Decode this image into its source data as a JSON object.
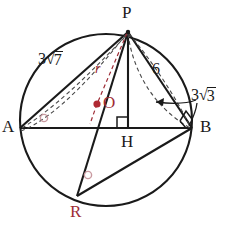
{
  "figure": {
    "kind": "circle-geometry-diagram",
    "colors": {
      "stroke": "#1a1a1a",
      "accent_red": "#9e2b35",
      "angle_mark": "#c99aa0",
      "background": "#ffffff"
    }
  },
  "points": {
    "P": {
      "label": "P",
      "x": 128,
      "y": 32,
      "label_x": 122,
      "label_y": 4,
      "color": "#1a1a1a"
    },
    "A": {
      "label": "A",
      "x": 20,
      "y": 128,
      "label_x": 2,
      "label_y": 120,
      "color": "#1a1a1a"
    },
    "B": {
      "label": "B",
      "x": 192,
      "y": 128,
      "label_x": 199,
      "label_y": 120,
      "color": "#1a1a1a"
    },
    "H": {
      "label": "H",
      "x": 128,
      "y": 128,
      "label_x": 121,
      "label_y": 133,
      "color": "#1a1a1a"
    },
    "O": {
      "label": "O",
      "x": 97,
      "y": 104,
      "label_x": 103,
      "label_y": 95,
      "color": "#9e2b35"
    },
    "R": {
      "label": "R",
      "x": 77,
      "y": 196,
      "label_x": 70,
      "label_y": 204,
      "color": "#9e2b35"
    }
  },
  "circle": {
    "cx": 106,
    "cy": 120,
    "r": 86
  },
  "segment_labels": [
    {
      "name": "AP",
      "text_prefix": "3",
      "radicand": "7",
      "has_radical": true,
      "x": 40,
      "y": 52
    },
    {
      "name": "PB",
      "text_prefix": "6",
      "radicand": "",
      "has_radical": false,
      "x": 152,
      "y": 62
    },
    {
      "name": "PH",
      "text_prefix": "3",
      "radicand": "3",
      "has_radical": true,
      "x": 185,
      "y": 88
    },
    {
      "name": "OP-radius",
      "text_prefix": "r",
      "radicand": "",
      "has_radical": false,
      "x": 95,
      "y": 68
    }
  ],
  "marks": {
    "right_angles": [
      {
        "at": "H",
        "x": 128,
        "y": 128,
        "note": "PH perpendicular to AB"
      },
      {
        "at": "B",
        "x": 192,
        "y": 128,
        "note": "angle PBR is a right angle"
      }
    ],
    "angle_circles": [
      {
        "at": "A",
        "x": 44,
        "y": 118,
        "note": "inscribed angle PAB"
      },
      {
        "at": "R",
        "x": 88,
        "y": 175,
        "note": "inscribed angle PRB"
      }
    ]
  },
  "lengths": {
    "AP": "3√7",
    "PB": "6",
    "PH": "3√3",
    "radius": "r"
  }
}
